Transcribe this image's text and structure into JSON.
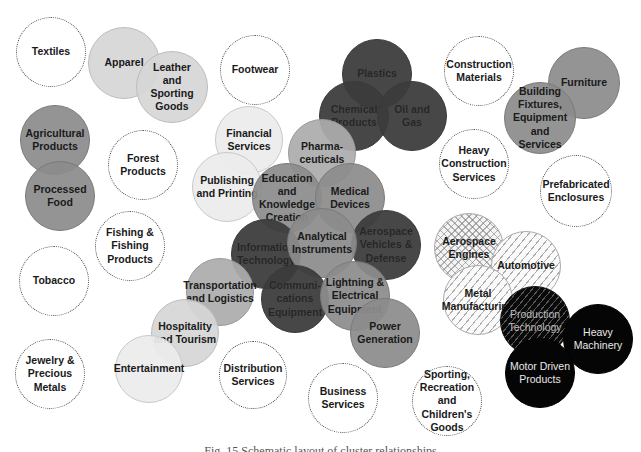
{
  "diagram": {
    "caption": "Fig. 15 Schematic layout of cluster relationships",
    "legend_styles": {
      "dotted": "isolated cluster (white, dotted outline)",
      "light": "light gray group",
      "mid": "medium gray group",
      "dark": "dark gray group",
      "hatch": "hatched manufacturing group",
      "black": "black machinery group"
    },
    "colors": {
      "white": "#ffffff",
      "light_gray": "#d6d6d6",
      "very_light_gray": "#ececec",
      "mid_gray": "#8c8c8c",
      "dark_gray": "#3c3c3c",
      "black": "#050505"
    },
    "circles": [
      {
        "id": "textiles",
        "label": "Textiles",
        "style": "dotted",
        "x": 51,
        "y": 52,
        "r": 35
      },
      {
        "id": "apparel",
        "label": "Apparel",
        "style": "light",
        "x": 124,
        "y": 63,
        "r": 36
      },
      {
        "id": "leather",
        "label": "Leather\nand\nSporting\nGoods",
        "style": "light",
        "x": 172,
        "y": 87,
        "r": 36
      },
      {
        "id": "footwear",
        "label": "Footwear",
        "style": "dotted",
        "x": 255,
        "y": 70,
        "r": 35
      },
      {
        "id": "plastics",
        "label": "Plastics",
        "style": "dark",
        "x": 377,
        "y": 74,
        "r": 35
      },
      {
        "id": "chemical",
        "label": "Chemical\nProducts",
        "style": "dark",
        "x": 354,
        "y": 116,
        "r": 35
      },
      {
        "id": "oil_gas",
        "label": "Oil and\nGas",
        "style": "dark",
        "x": 412,
        "y": 116,
        "r": 35
      },
      {
        "id": "construction_materials",
        "label": "Construction\nMaterials",
        "style": "dotted",
        "x": 479,
        "y": 71,
        "r": 35
      },
      {
        "id": "furniture",
        "label": "Furniture",
        "style": "mid",
        "x": 584,
        "y": 83,
        "r": 36
      },
      {
        "id": "building_fixtures",
        "label": "Building\nFixtures,\nEquipment\nand\nServices",
        "style": "mid",
        "x": 540,
        "y": 118,
        "r": 36
      },
      {
        "id": "agricultural",
        "label": "Agricultural\nProducts",
        "style": "mid",
        "x": 55,
        "y": 140,
        "r": 35
      },
      {
        "id": "processed_food",
        "label": "Processed\nFood",
        "style": "mid",
        "x": 60,
        "y": 196,
        "r": 35
      },
      {
        "id": "forest",
        "label": "Forest\nProducts",
        "style": "dotted",
        "x": 143,
        "y": 165,
        "r": 35
      },
      {
        "id": "financial",
        "label": "Financial\nServices",
        "style": "vlight",
        "x": 249,
        "y": 140,
        "r": 34
      },
      {
        "id": "publishing",
        "label": "Publishing\nand Printing",
        "style": "vlight",
        "x": 227,
        "y": 187,
        "r": 35
      },
      {
        "id": "pharma",
        "label": "Pharma-\nceuticals",
        "style": "midlight",
        "x": 322,
        "y": 153,
        "r": 34
      },
      {
        "id": "education",
        "label": "Education\nand\nKnowledge\nCreation",
        "style": "mid",
        "x": 287,
        "y": 198,
        "r": 35
      },
      {
        "id": "medical",
        "label": "Medical\nDevices",
        "style": "mid",
        "x": 350,
        "y": 198,
        "r": 35
      },
      {
        "id": "heavy_construction",
        "label": "Heavy\nConstruction\nServices",
        "style": "dotted",
        "x": 474,
        "y": 164,
        "r": 35
      },
      {
        "id": "prefab",
        "label": "Prefabricated\nEnclosures",
        "style": "dotted",
        "x": 576,
        "y": 191,
        "r": 36
      },
      {
        "id": "fishing",
        "label": "Fishing &\nFishing\nProducts",
        "style": "dotted",
        "x": 130,
        "y": 246,
        "r": 35
      },
      {
        "id": "aerospace_vehicles",
        "label": "Aerospace\nVehicles &\nDefense",
        "style": "dark",
        "x": 386,
        "y": 245,
        "r": 35
      },
      {
        "id": "information_tech",
        "label": "Information\nTechnology",
        "style": "dark",
        "x": 266,
        "y": 254,
        "r": 35
      },
      {
        "id": "analytical",
        "label": "Analytical\nInstruments",
        "style": "mid",
        "x": 322,
        "y": 243,
        "r": 35
      },
      {
        "id": "aerospace_engines",
        "label": "Aerospace\nEngines",
        "style": "crosshatch",
        "x": 469,
        "y": 248,
        "r": 35
      },
      {
        "id": "automotive",
        "label": "Automotive",
        "style": "hatch",
        "x": 526,
        "y": 266,
        "r": 35
      },
      {
        "id": "tobacco",
        "label": "Tobacco",
        "style": "dotted",
        "x": 54,
        "y": 281,
        "r": 35
      },
      {
        "id": "transportation",
        "label": "Transportation\nand Logistics",
        "style": "midlight",
        "x": 220,
        "y": 292,
        "r": 34
      },
      {
        "id": "communications",
        "label": "Communi-\ncations\nEquipment",
        "style": "dark",
        "x": 295,
        "y": 299,
        "r": 34
      },
      {
        "id": "lightning",
        "label": "Lightning &\nElectrical\nEquipment",
        "style": "mid",
        "x": 355,
        "y": 296,
        "r": 35
      },
      {
        "id": "metal_manufacturing",
        "label": "Metal\nManufacturing",
        "style": "hatch",
        "x": 478,
        "y": 300,
        "r": 35
      },
      {
        "id": "production_tech",
        "label": "Production\nTechnology",
        "style": "darkhatch",
        "x": 535,
        "y": 321,
        "r": 35
      },
      {
        "id": "heavy_machinery",
        "label": "Heavy\nMachinery",
        "style": "black",
        "x": 598,
        "y": 339,
        "r": 35
      },
      {
        "id": "hospitality",
        "label": "Hospitality\nand Tourism",
        "style": "light",
        "x": 185,
        "y": 333,
        "r": 34
      },
      {
        "id": "power_gen",
        "label": "Power\nGeneration",
        "style": "mid",
        "x": 385,
        "y": 333,
        "r": 35
      },
      {
        "id": "jewelry",
        "label": "Jewelry &\nPrecious\nMetals",
        "style": "dotted",
        "x": 50,
        "y": 374,
        "r": 35
      },
      {
        "id": "entertainment",
        "label": "Entertainment",
        "style": "vlight",
        "x": 149,
        "y": 369,
        "r": 34
      },
      {
        "id": "distribution",
        "label": "Distribution\nServices",
        "style": "dotted",
        "x": 253,
        "y": 375,
        "r": 34
      },
      {
        "id": "business",
        "label": "Business\nServices",
        "style": "dotted",
        "x": 343,
        "y": 398,
        "r": 35
      },
      {
        "id": "sporting",
        "label": "Sporting,\nRecreation and\nChildren's\nGoods",
        "style": "dotted",
        "x": 447,
        "y": 401,
        "r": 35
      },
      {
        "id": "motor_driven",
        "label": "Motor Driven\nProducts",
        "style": "black",
        "x": 540,
        "y": 373,
        "r": 35
      }
    ]
  }
}
